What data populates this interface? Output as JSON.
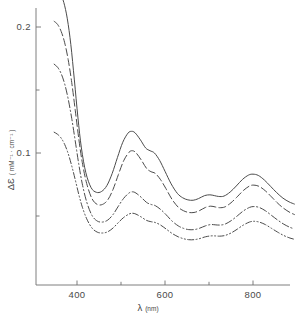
{
  "chart_data": {
    "type": "line",
    "title": "",
    "xlabel": "λ (nm)",
    "ylabel": "ΔƐ (mM⁻¹·cm⁻¹)",
    "xlabel_symbol": "λ",
    "xlabel_unit": "(nm)",
    "ylabel_symbol": "ΔƐ",
    "ylabel_unit": "( mM⁻¹ · cm⁻¹ )",
    "xlim": [
      330,
      900
    ],
    "ylim": [
      0.0,
      0.232
    ],
    "grid": false,
    "legend": "none",
    "x_major_ticks": [
      400,
      600,
      800
    ],
    "x_major_tick_labels": [
      "400",
      "600",
      "800"
    ],
    "x_minor_ticks": [
      500,
      700,
      900
    ],
    "y_major_ticks": [
      0.1,
      0.2
    ],
    "y_major_tick_labels": [
      "0.1",
      "0.2"
    ],
    "y_minor_ticks": [
      0.05,
      0.15
    ],
    "series": [
      {
        "name": "curve-1",
        "style": "solid",
        "x": [
          348,
          355,
          362,
          370,
          378,
          386,
          394,
          402,
          410,
          420,
          432,
          444,
          456,
          468,
          480,
          492,
          504,
          516,
          524,
          532,
          544,
          556,
          566,
          576,
          588,
          600,
          614,
          628,
          640,
          652,
          664,
          676,
          690,
          702,
          712,
          722,
          734,
          748,
          762,
          776,
          790,
          800,
          812,
          826,
          840,
          854,
          868,
          882,
          894
        ],
        "y": [
          0.2315,
          0.23,
          0.2265,
          0.2195,
          0.2065,
          0.186,
          0.158,
          0.1285,
          0.104,
          0.0845,
          0.0725,
          0.0688,
          0.0695,
          0.0742,
          0.0838,
          0.0965,
          0.1085,
          0.1158,
          0.1172,
          0.116,
          0.1105,
          0.104,
          0.1018,
          0.1,
          0.094,
          0.0855,
          0.0755,
          0.068,
          0.0645,
          0.0628,
          0.0625,
          0.0638,
          0.0662,
          0.0668,
          0.0662,
          0.0655,
          0.0658,
          0.069,
          0.0738,
          0.079,
          0.0825,
          0.0832,
          0.0822,
          0.0785,
          0.0735,
          0.0685,
          0.0642,
          0.0612,
          0.0595
        ]
      },
      {
        "name": "curve-2",
        "style": "dashed",
        "x": [
          348,
          356,
          364,
          372,
          380,
          388,
          396,
          404,
          412,
          422,
          434,
          446,
          458,
          470,
          482,
          494,
          506,
          518,
          526,
          534,
          546,
          558,
          568,
          578,
          590,
          602,
          616,
          630,
          642,
          654,
          666,
          678,
          692,
          704,
          714,
          724,
          736,
          750,
          764,
          778,
          792,
          802,
          814,
          828,
          842,
          856,
          870,
          884,
          894
        ],
        "y": [
          0.2045,
          0.202,
          0.1965,
          0.1875,
          0.174,
          0.156,
          0.134,
          0.1115,
          0.0925,
          0.0758,
          0.0638,
          0.0592,
          0.0592,
          0.0628,
          0.0712,
          0.0828,
          0.0938,
          0.1005,
          0.1018,
          0.1002,
          0.0945,
          0.0878,
          0.0852,
          0.0838,
          0.0788,
          0.0718,
          0.0632,
          0.057,
          0.0542,
          0.0528,
          0.0528,
          0.0542,
          0.0568,
          0.0578,
          0.0572,
          0.0566,
          0.0572,
          0.0605,
          0.0652,
          0.0702,
          0.0738,
          0.0745,
          0.0735,
          0.07,
          0.0652,
          0.0602,
          0.056,
          0.0528,
          0.0512
        ]
      },
      {
        "name": "curve-3",
        "style": "dash-dot",
        "x": [
          348,
          356,
          364,
          372,
          380,
          388,
          396,
          404,
          412,
          422,
          434,
          446,
          458,
          470,
          482,
          494,
          506,
          518,
          526,
          534,
          546,
          558,
          568,
          578,
          590,
          602,
          616,
          630,
          642,
          654,
          666,
          678,
          692,
          704,
          714,
          724,
          736,
          750,
          764,
          778,
          792,
          802,
          814,
          828,
          842,
          856,
          870,
          884,
          894
        ],
        "y": [
          0.1705,
          0.168,
          0.163,
          0.1548,
          0.1428,
          0.1275,
          0.1095,
          0.0912,
          0.0755,
          0.0612,
          0.0505,
          0.046,
          0.0452,
          0.0468,
          0.0512,
          0.0578,
          0.064,
          0.0682,
          0.0692,
          0.0682,
          0.0648,
          0.0608,
          0.0592,
          0.0582,
          0.0552,
          0.0512,
          0.046,
          0.0422,
          0.0402,
          0.0392,
          0.0392,
          0.0402,
          0.0422,
          0.0432,
          0.043,
          0.0428,
          0.0435,
          0.0462,
          0.05,
          0.054,
          0.0568,
          0.0575,
          0.0568,
          0.0542,
          0.0505,
          0.0468,
          0.0435,
          0.041,
          0.0398
        ]
      },
      {
        "name": "curve-4",
        "style": "dash-dot-dot",
        "x": [
          348,
          356,
          364,
          372,
          380,
          388,
          396,
          404,
          412,
          422,
          434,
          446,
          458,
          470,
          482,
          494,
          506,
          518,
          526,
          534,
          546,
          558,
          568,
          578,
          590,
          602,
          616,
          630,
          642,
          654,
          666,
          678,
          692,
          704,
          714,
          724,
          736,
          750,
          764,
          778,
          792,
          802,
          814,
          828,
          842,
          856,
          870,
          884,
          894
        ],
        "y": [
          0.1165,
          0.1148,
          0.1118,
          0.1068,
          0.0995,
          0.0898,
          0.0788,
          0.0672,
          0.0572,
          0.0478,
          0.0405,
          0.0372,
          0.0365,
          0.0375,
          0.0405,
          0.0448,
          0.0488,
          0.0515,
          0.0522,
          0.0515,
          0.0492,
          0.0465,
          0.0455,
          0.0448,
          0.0428,
          0.0398,
          0.0362,
          0.0335,
          0.032,
          0.0312,
          0.0312,
          0.032,
          0.0335,
          0.0342,
          0.0342,
          0.034,
          0.0345,
          0.0365,
          0.0395,
          0.0428,
          0.0452,
          0.0458,
          0.0452,
          0.0432,
          0.0402,
          0.0372,
          0.0345,
          0.0325,
          0.0315
        ]
      }
    ]
  }
}
